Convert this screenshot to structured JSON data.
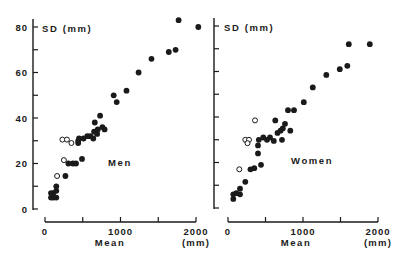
{
  "figure": {
    "background": "#ffffff",
    "ink": "#1a1a1a"
  },
  "chart_data": [
    {
      "type": "scatter",
      "title": "",
      "panel_label": "Men",
      "xlabel": "Mean",
      "xunit": "(mm)",
      "ylabel": "SD (mm)",
      "xlim": [
        0,
        2000
      ],
      "ylim": [
        0,
        80
      ],
      "xticks": [
        0,
        500,
        1000,
        1500,
        2000
      ],
      "xtick_labels": [
        "0",
        "",
        "1000",
        "",
        "2000"
      ],
      "yticks": [
        0,
        10,
        20,
        30,
        40,
        50,
        60,
        70,
        80
      ],
      "ytick_labels": [
        "0",
        "",
        "20",
        "",
        "40",
        "",
        "60",
        "",
        "80"
      ],
      "grid": false,
      "legend": null,
      "series": [
        {
          "name": "filled",
          "marker": "filled-circle",
          "points": [
            [
              80,
              5
            ],
            [
              80,
              7
            ],
            [
              110,
              5
            ],
            [
              110,
              7
            ],
            [
              150,
              5
            ],
            [
              150,
              8
            ],
            [
              150,
              10
            ],
            [
              270,
              14.5
            ],
            [
              310,
              20
            ],
            [
              370,
              20
            ],
            [
              410,
              20
            ],
            [
              490,
              22
            ],
            [
              440,
              29
            ],
            [
              440,
              30
            ],
            [
              450,
              31
            ],
            [
              510,
              31
            ],
            [
              560,
              32
            ],
            [
              600,
              32
            ],
            [
              640,
              31
            ],
            [
              650,
              34
            ],
            [
              660,
              38
            ],
            [
              690,
              33
            ],
            [
              700,
              35
            ],
            [
              730,
              41
            ],
            [
              760,
              36
            ],
            [
              790,
              35
            ],
            [
              910,
              50
            ],
            [
              950,
              47
            ],
            [
              1080,
              52
            ],
            [
              1240,
              60
            ],
            [
              1410,
              66
            ],
            [
              1640,
              69
            ],
            [
              1730,
              70
            ],
            [
              1770,
              83
            ],
            [
              2030,
              80
            ]
          ]
        },
        {
          "name": "open",
          "marker": "open-circle",
          "points": [
            [
              160,
              14.5
            ],
            [
              250,
              21.5
            ],
            [
              230,
              30.5
            ],
            [
              290,
              30.5
            ],
            [
              350,
              29
            ]
          ]
        }
      ]
    },
    {
      "type": "scatter",
      "title": "",
      "panel_label": "Women",
      "xlabel": "Mean",
      "xunit": "(mm)",
      "ylabel": "SD (mm)",
      "xlim": [
        0,
        2000
      ],
      "ylim": [
        0,
        80
      ],
      "xticks": [
        0,
        500,
        1000,
        1500,
        2000
      ],
      "xtick_labels": [
        "0",
        "",
        "1000",
        "",
        "2000"
      ],
      "yticks": [
        0,
        10,
        20,
        30,
        40,
        50,
        60,
        70,
        80
      ],
      "ytick_labels": [
        "",
        "",
        "",
        "",
        "",
        "",
        "",
        "",
        ""
      ],
      "grid": false,
      "legend": null,
      "series": [
        {
          "name": "filled",
          "marker": "filled-circle",
          "points": [
            [
              70,
              4
            ],
            [
              70,
              6
            ],
            [
              110,
              6.5
            ],
            [
              160,
              6
            ],
            [
              160,
              8.5
            ],
            [
              230,
              11.5
            ],
            [
              300,
              17
            ],
            [
              350,
              17.5
            ],
            [
              440,
              19
            ],
            [
              400,
              24
            ],
            [
              400,
              27.5
            ],
            [
              410,
              30
            ],
            [
              470,
              31
            ],
            [
              520,
              30
            ],
            [
              560,
              31
            ],
            [
              610,
              29.5
            ],
            [
              630,
              38.5
            ],
            [
              660,
              33
            ],
            [
              700,
              34
            ],
            [
              720,
              30
            ],
            [
              730,
              35
            ],
            [
              760,
              37
            ],
            [
              830,
              34
            ],
            [
              800,
              43
            ],
            [
              880,
              43
            ],
            [
              1010,
              46.5
            ],
            [
              1130,
              53
            ],
            [
              1310,
              58.5
            ],
            [
              1490,
              61
            ],
            [
              1590,
              62.5
            ],
            [
              1610,
              72
            ],
            [
              1890,
              72
            ]
          ]
        },
        {
          "name": "open",
          "marker": "open-circle",
          "points": [
            [
              150,
              17
            ],
            [
              230,
              30
            ],
            [
              280,
              30
            ],
            [
              260,
              28.5
            ],
            [
              360,
              38.5
            ]
          ]
        }
      ]
    }
  ],
  "panels": {
    "men": {
      "ylabel": "SD (mm)",
      "label": "Men",
      "xlabel": "Mean",
      "xunit": "(mm)"
    },
    "women": {
      "ylabel": "SD (mm)",
      "label": "Women",
      "xlabel": "Mean",
      "xunit": "(mm)"
    }
  }
}
